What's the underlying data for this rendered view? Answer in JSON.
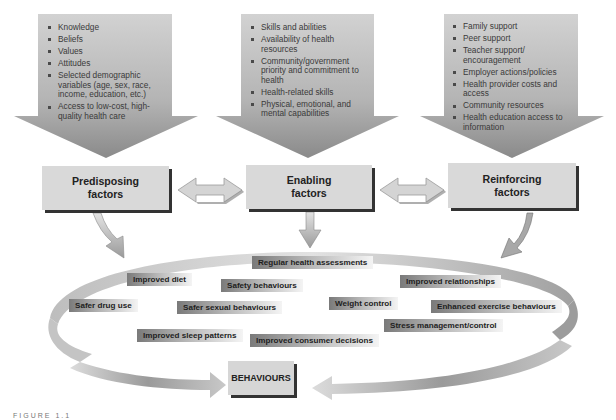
{
  "diagram": {
    "type": "health-behaviour-model",
    "colors": {
      "arrow_fill_top": "#c8c8c8",
      "arrow_fill_bottom": "#8c8c8c",
      "box_fill": "#d9d9d9",
      "box_shadow": "#333333",
      "band_light": "#dcdcdc",
      "band_dark": "#8a8a8a",
      "tag_dark": "#7a7a7a"
    },
    "factor_arrows": [
      {
        "id": "predisposing",
        "items": [
          "Knowledge",
          "Beliefs",
          "Values",
          "Attitudes",
          "Selected demographic variables (age, sex, race, income, education, etc.)",
          "Access to low-cost, high-quality health care"
        ]
      },
      {
        "id": "enabling",
        "items": [
          "Skills and abilities",
          "Availability of health resources",
          "Community/government priority and commitment to health",
          "Health-related skills",
          "Physical, emotional, and mental capabilities"
        ]
      },
      {
        "id": "reinforcing",
        "items": [
          "Family support",
          "Peer support",
          "Teacher support/ encouragement",
          "Employer actions/policies",
          "Health provider costs and access",
          "Community resources",
          "Health education access to information"
        ]
      }
    ],
    "factor_boxes": [
      {
        "line1": "Predisposing",
        "line2": "factors"
      },
      {
        "line1": "Enabling",
        "line2": "factors"
      },
      {
        "line1": "Reinforcing",
        "line2": "factors"
      }
    ],
    "behaviour_items": [
      "Regular health assessments",
      "Improved diet",
      "Safety behaviours",
      "Improved relationships",
      "Safer drug use",
      "Weight control",
      "Enhanced exercise behaviours",
      "Safer sexual behaviours",
      "Stress management/control",
      "Improved sleep patterns",
      "Improved consumer decisions"
    ],
    "outcome_box": "BEHAVIOURS",
    "caption": "FIGURE 1.1"
  }
}
